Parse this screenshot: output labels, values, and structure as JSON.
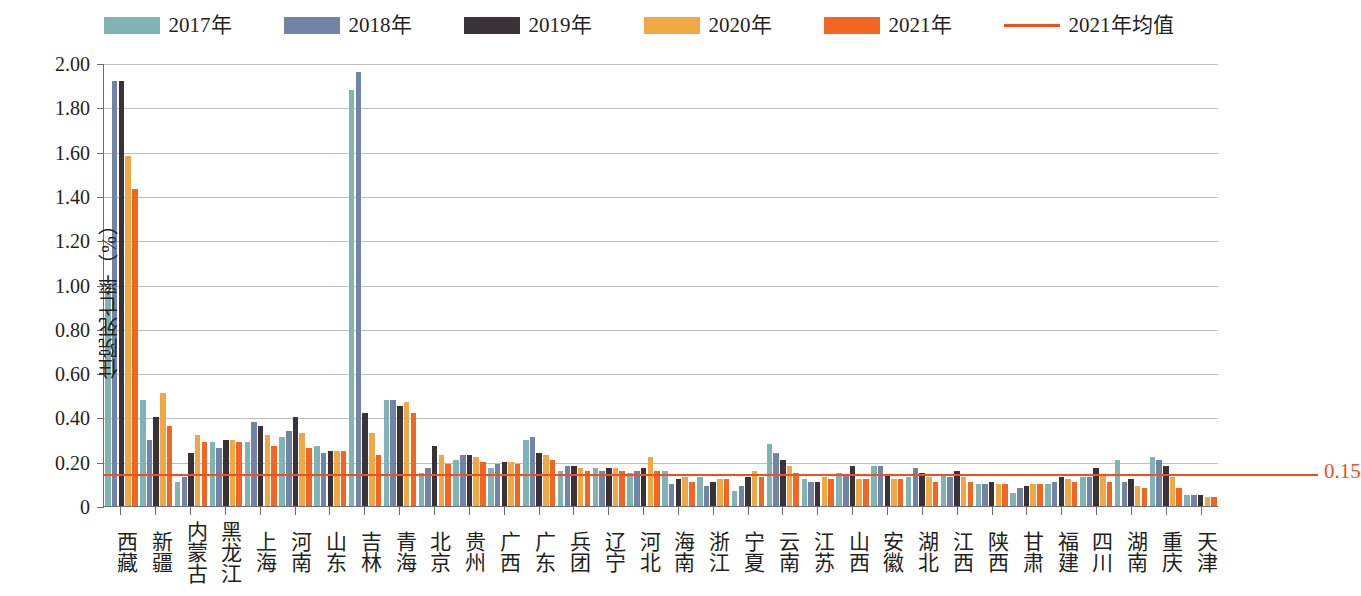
{
  "chart_data": {
    "type": "bar",
    "title": "",
    "xlabel": "",
    "ylabel": "住院死亡率（%）",
    "ylim": [
      0,
      2.0
    ],
    "ytick_labels": [
      "2.00",
      "1.80",
      "1.60",
      "1.40",
      "1.20",
      "1.00",
      "0.80",
      "0.60",
      "0.40",
      "0.20",
      "0"
    ],
    "ytick_values": [
      2.0,
      1.8,
      1.6,
      1.4,
      1.2,
      1.0,
      0.8,
      0.6,
      0.4,
      0.2,
      0
    ],
    "grid": true,
    "legend_position": "top-center",
    "categories": [
      "西藏",
      "新疆",
      "内蒙古",
      "黑龙江",
      "上海",
      "河南",
      "山东",
      "吉林",
      "青海",
      "北京",
      "贵州",
      "广西",
      "广东",
      "兵团",
      "辽宁",
      "河北",
      "海南",
      "浙江",
      "宁夏",
      "云南",
      "江苏",
      "山西",
      "安徽",
      "湖北",
      "江西",
      "陕西",
      "甘肃",
      "福建",
      "四川",
      "湖南",
      "重庆",
      "天津"
    ],
    "series": [
      {
        "name": "2017年",
        "color": "#7FB3B5",
        "values": [
          0.97,
          0.48,
          0.11,
          0.29,
          0.29,
          0.31,
          0.27,
          1.88,
          0.48,
          0.15,
          0.21,
          0.17,
          0.3,
          0.16,
          0.17,
          0.15,
          0.16,
          0.13,
          0.07,
          0.28,
          0.12,
          0.15,
          0.18,
          0.13,
          0.14,
          0.1,
          0.06,
          0.1,
          0.13,
          0.21,
          0.22,
          0.05
        ]
      },
      {
        "name": "2018年",
        "color": "#7283A8",
        "values": [
          1.92,
          0.3,
          0.13,
          0.26,
          0.38,
          0.34,
          0.24,
          1.96,
          0.48,
          0.17,
          0.23,
          0.19,
          0.31,
          0.18,
          0.16,
          0.16,
          0.1,
          0.09,
          0.09,
          0.24,
          0.11,
          0.14,
          0.18,
          0.17,
          0.13,
          0.1,
          0.08,
          0.11,
          0.13,
          0.11,
          0.21,
          0.05
        ]
      },
      {
        "name": "2019年",
        "color": "#3B3139",
        "values": [
          1.92,
          0.4,
          0.24,
          0.3,
          0.36,
          0.4,
          0.25,
          0.42,
          0.45,
          0.27,
          0.23,
          0.2,
          0.24,
          0.18,
          0.17,
          0.17,
          0.12,
          0.11,
          0.13,
          0.21,
          0.11,
          0.18,
          0.14,
          0.15,
          0.16,
          0.11,
          0.09,
          0.13,
          0.17,
          0.12,
          0.18,
          0.05
        ]
      },
      {
        "name": "2020年",
        "color": "#F0A844",
        "values": [
          1.58,
          0.51,
          0.32,
          0.3,
          0.32,
          0.33,
          0.25,
          0.33,
          0.47,
          0.23,
          0.22,
          0.2,
          0.23,
          0.17,
          0.17,
          0.22,
          0.13,
          0.12,
          0.16,
          0.18,
          0.13,
          0.12,
          0.12,
          0.13,
          0.13,
          0.1,
          0.1,
          0.12,
          0.14,
          0.09,
          0.13,
          0.04
        ]
      },
      {
        "name": "2021年",
        "color": "#F26522",
        "values": [
          1.43,
          0.36,
          0.29,
          0.29,
          0.27,
          0.26,
          0.25,
          0.23,
          0.42,
          0.19,
          0.2,
          0.19,
          0.21,
          0.16,
          0.16,
          0.16,
          0.11,
          0.12,
          0.13,
          0.15,
          0.12,
          0.12,
          0.12,
          0.11,
          0.11,
          0.1,
          0.1,
          0.11,
          0.11,
          0.08,
          0.08,
          0.04
        ]
      }
    ],
    "mean_line": {
      "label": "2021年均值",
      "value_label": "0.15",
      "value": 0.15,
      "color": "#F04E23"
    }
  },
  "legend": {
    "items": [
      {
        "label": "2017年",
        "color": "#7FB3B5",
        "kind": "swatch"
      },
      {
        "label": "2018年",
        "color": "#7283A8",
        "kind": "swatch"
      },
      {
        "label": "2019年",
        "color": "#3B3139",
        "kind": "swatch"
      },
      {
        "label": "2020年",
        "color": "#F0A844",
        "kind": "swatch"
      },
      {
        "label": "2021年",
        "color": "#F26522",
        "kind": "swatch"
      },
      {
        "label": "2021年均值",
        "color": "#F04E23",
        "kind": "line"
      }
    ]
  }
}
